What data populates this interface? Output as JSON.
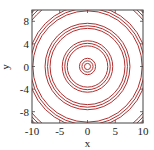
{
  "chart_data": {
    "type": "contour",
    "title": "",
    "xlabel": "x",
    "ylabel": "y",
    "xlim": [
      -10,
      10
    ],
    "ylim": [
      -10,
      10
    ],
    "xticks": [
      -10,
      -5,
      0,
      5,
      10
    ],
    "yticks": [
      -8,
      -4,
      0,
      4,
      8
    ],
    "grid": false,
    "legend": null,
    "line_color": "#b03030",
    "contour_groups": [
      {
        "center_radius": 1.0,
        "radii": [
          0.55,
          1.0,
          1.45
        ]
      },
      {
        "center_radius": 4.1,
        "radii": [
          3.65,
          4.1,
          4.55
        ]
      },
      {
        "center_radius": 7.2,
        "radii": [
          6.75,
          7.2,
          7.65
        ]
      },
      {
        "center_radius": 10.3,
        "radii": [
          9.85,
          10.3,
          10.75
        ]
      },
      {
        "center_radius": 13.4,
        "radii": [
          12.95,
          13.4,
          13.85
        ]
      }
    ]
  },
  "axes": {
    "x_label": "x",
    "y_label": "y"
  }
}
